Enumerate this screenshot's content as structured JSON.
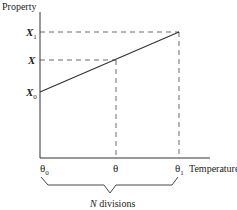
{
  "diagram": {
    "y_axis_label": "Property",
    "x_axis_label": "Temperature",
    "y_ticks": [
      {
        "symbol": "X",
        "subscript": "1"
      },
      {
        "symbol": "X",
        "subscript": ""
      },
      {
        "symbol": "X",
        "subscript": "0"
      }
    ],
    "x_ticks": [
      {
        "symbol": "θ",
        "subscript": "0"
      },
      {
        "symbol": "θ",
        "subscript": ""
      },
      {
        "symbol": "θ",
        "subscript": "1"
      }
    ],
    "brace_label_n": "N",
    "brace_label_rest": " divisions",
    "line_color": "#333333",
    "axis_color": "#333333"
  }
}
